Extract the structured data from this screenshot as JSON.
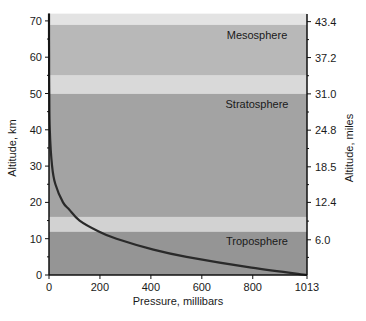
{
  "chart_data": {
    "type": "line",
    "title": "",
    "xlabel": "Pressure, millibars",
    "ylabel": "Altitude, km",
    "y2label": "Altitude, miles",
    "xlim": [
      0,
      1013
    ],
    "ylim": [
      0,
      72
    ],
    "x_ticks": [
      0,
      200,
      400,
      600,
      800,
      1013
    ],
    "y_ticks": [
      0,
      10,
      20,
      30,
      40,
      50,
      60,
      70
    ],
    "y2_ticks": [
      {
        "label": "6.0",
        "km": 9.7
      },
      {
        "label": "12.4",
        "km": 20
      },
      {
        "label": "18.5",
        "km": 29.8
      },
      {
        "label": "24.8",
        "km": 39.9
      },
      {
        "label": "31.0",
        "km": 49.9
      },
      {
        "label": "37.2",
        "km": 59.9
      },
      {
        "label": "43.4",
        "km": 69.8
      }
    ],
    "grid": false,
    "series": [
      {
        "name": "Pressure vs altitude",
        "points": [
          {
            "pressure": 1013,
            "altitude": 0
          },
          {
            "pressure": 795,
            "altitude": 2
          },
          {
            "pressure": 540,
            "altitude": 5
          },
          {
            "pressure": 410,
            "altitude": 7
          },
          {
            "pressure": 265,
            "altitude": 10
          },
          {
            "pressure": 195,
            "altitude": 12
          },
          {
            "pressure": 120,
            "altitude": 15
          },
          {
            "pressure": 80,
            "altitude": 18
          },
          {
            "pressure": 55,
            "altitude": 20
          },
          {
            "pressure": 25,
            "altitude": 25
          },
          {
            "pressure": 12,
            "altitude": 30
          },
          {
            "pressure": 3,
            "altitude": 40
          },
          {
            "pressure": 1,
            "altitude": 50
          },
          {
            "pressure": 0.2,
            "altitude": 60
          },
          {
            "pressure": 0.05,
            "altitude": 72
          }
        ]
      }
    ],
    "layers": [
      {
        "name": "Troposphere",
        "from": 0,
        "to": 12,
        "color": "#959595"
      },
      {
        "name": "",
        "from": 12,
        "to": 16,
        "color": "#d2d2d2"
      },
      {
        "name": "Stratosphere",
        "from": 16,
        "to": 50,
        "color": "#a3a3a3"
      },
      {
        "name": "",
        "from": 50,
        "to": 55,
        "color": "#d9d9d9"
      },
      {
        "name": "Mesosphere",
        "from": 55,
        "to": 69,
        "color": "#b8b8b8"
      },
      {
        "name": "",
        "from": 69,
        "to": 72,
        "color": "#e3e3e3"
      }
    ],
    "annotations": [
      {
        "text": "Mesosphere",
        "altitude": 66
      },
      {
        "text": "Stratosphere",
        "altitude": 47
      },
      {
        "text": "Troposphere",
        "altitude": 9.5
      }
    ]
  },
  "labels": {
    "xlabel": "Pressure, millibars",
    "ylabel": "Altitude, km",
    "y2label": "Altitude, miles"
  },
  "colors": {
    "curve": "#2a2a2a",
    "axis": "#111111"
  }
}
